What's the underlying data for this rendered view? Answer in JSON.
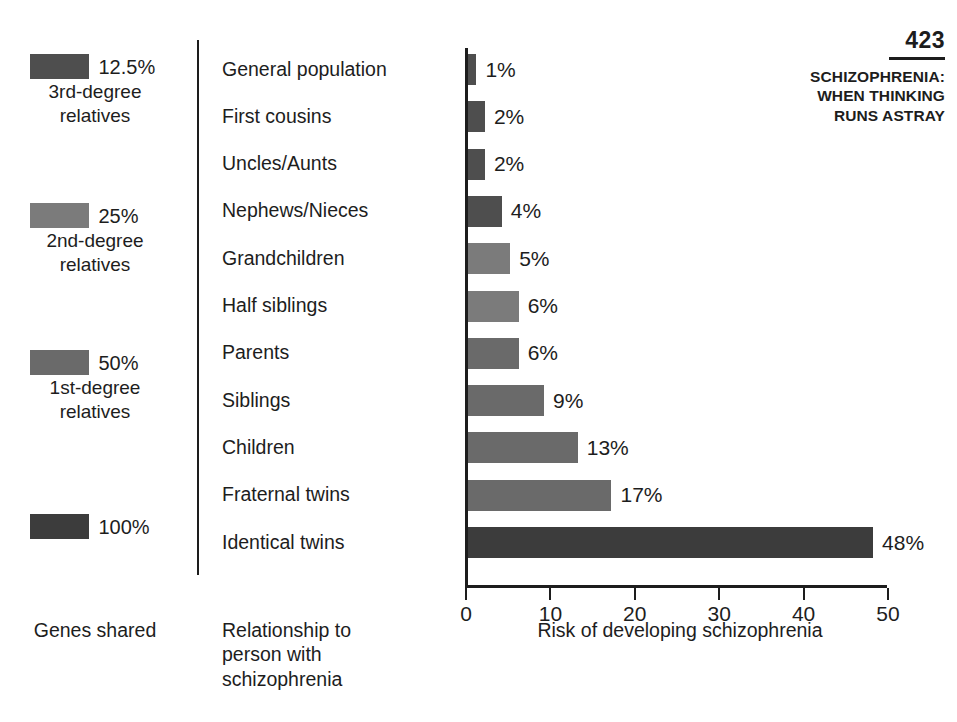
{
  "page": {
    "number": "423",
    "title_line1": "SCHIZOPHRENIA:",
    "title_line2": "WHEN THINKING",
    "title_line3": "RUNS ASTRAY"
  },
  "captions": {
    "genes_shared": "Genes shared",
    "relationship_line1": "Relationship to",
    "relationship_line2": "person with",
    "relationship_line3": "schizophrenia",
    "risk_axis": "Risk of developing schizophrenia"
  },
  "legend": {
    "items": [
      {
        "percent": "12.5%",
        "group_line1": "3rd-degree",
        "group_line2": "relatives",
        "color": "#4e4e4e",
        "top": 14
      },
      {
        "percent": "25%",
        "group_line1": "2nd-degree",
        "group_line2": "relatives",
        "color": "#7b7b7b",
        "top": 163
      },
      {
        "percent": "50%",
        "group_line1": "1st-degree",
        "group_line2": "relatives",
        "color": "#6a6a6a",
        "top": 310
      },
      {
        "percent": "100%",
        "group_line1": "",
        "group_line2": "",
        "color": "#3c3c3c",
        "top": 474
      }
    ]
  },
  "chart_data": {
    "type": "bar",
    "orientation": "horizontal",
    "title": "",
    "xlabel": "Risk of developing schizophrenia",
    "ylabel": "",
    "xlim": [
      0,
      50
    ],
    "xticks": [
      0,
      10,
      20,
      30,
      40,
      50
    ],
    "xtick_labels": [
      "0",
      "10",
      "20",
      "30",
      "40",
      "50"
    ],
    "grid": false,
    "legend_position": "left",
    "categories": [
      "General population",
      "First cousins",
      "Uncles/Aunts",
      "Nephews/Nieces",
      "Grandchildren",
      "Half siblings",
      "Parents",
      "Siblings",
      "Children",
      "Fraternal twins",
      "Identical twins"
    ],
    "values": [
      1,
      2,
      2,
      4,
      5,
      6,
      6,
      9,
      13,
      17,
      48
    ],
    "data_labels": [
      "1%",
      "2%",
      "2%",
      "4%",
      "5%",
      "6%",
      "6%",
      "9%",
      "13%",
      "17%",
      "48%"
    ],
    "genes_shared_group": [
      "12.5%",
      "12.5%",
      "12.5%",
      "12.5%",
      "25%",
      "25%",
      "50%",
      "50%",
      "50%",
      "50%",
      "100%"
    ],
    "bar_colors": [
      "#4e4e4e",
      "#4e4e4e",
      "#4e4e4e",
      "#4e4e4e",
      "#7b7b7b",
      "#7b7b7b",
      "#6a6a6a",
      "#6a6a6a",
      "#6a6a6a",
      "#6a6a6a",
      "#3c3c3c"
    ]
  }
}
